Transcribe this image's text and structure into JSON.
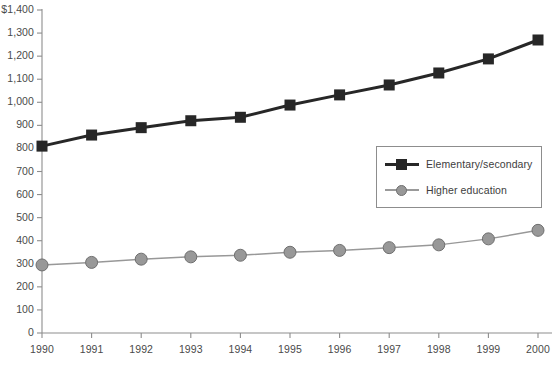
{
  "chart_data": {
    "type": "line",
    "title": "",
    "xlabel": "",
    "ylabel": "",
    "categories": [
      "1990",
      "1991",
      "1992",
      "1993",
      "1994",
      "1995",
      "1996",
      "1997",
      "1998",
      "1999",
      "2000"
    ],
    "x": [
      1990,
      1991,
      1992,
      1993,
      1994,
      1995,
      1996,
      1997,
      1998,
      1999,
      2000
    ],
    "series": [
      {
        "name": "Elementary/secondary",
        "color": "#272727",
        "marker": "square",
        "values": [
          810,
          858,
          890,
          920,
          935,
          988,
          1032,
          1075,
          1127,
          1188,
          1270
        ]
      },
      {
        "name": "Higher education",
        "color": "#989898",
        "marker": "circle",
        "values": [
          295,
          306,
          320,
          330,
          337,
          350,
          358,
          370,
          382,
          408,
          445
        ]
      }
    ],
    "ylim": [
      0,
      1400
    ],
    "ytick_step": 100,
    "ytick_labels": [
      "$1,400",
      "1,300",
      "1,200",
      "1,100",
      "1,000",
      "900",
      "800",
      "700",
      "600",
      "500",
      "400",
      "300",
      "200",
      "100",
      "0"
    ],
    "ytick_values": [
      1400,
      1300,
      1200,
      1100,
      1000,
      900,
      800,
      700,
      600,
      500,
      400,
      300,
      200,
      100,
      0
    ],
    "grid": false,
    "legend_position": "center-right",
    "axis_color": "#8d8d8d"
  },
  "legend": {
    "entries": [
      {
        "label": "Elementary/secondary"
      },
      {
        "label": "Higher education"
      }
    ]
  }
}
